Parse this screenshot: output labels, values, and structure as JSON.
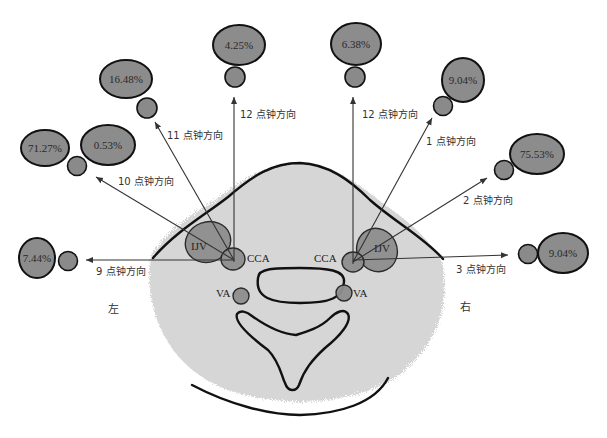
{
  "diagram": {
    "type": "neck cross-section clock-direction diagram",
    "side_labels": {
      "left": "左",
      "right": "右"
    },
    "structures": {
      "ijv_left": "IJV",
      "ijv_right": "IJV",
      "cca_left": "CCA",
      "cca_right": "CCA",
      "va_left": "VA",
      "va_right": "VA"
    },
    "left_directions": [
      {
        "clock": "9 点钟方向",
        "percent": "7.44%"
      },
      {
        "clock": "10 点钟方向",
        "percent": "71.27%",
        "percent_secondary": "0.53%"
      },
      {
        "clock": "11 点钟方向",
        "percent": "16.48%"
      },
      {
        "clock": "12 点钟方向",
        "percent": "4.25%"
      }
    ],
    "right_directions": [
      {
        "clock": "12 点钟方向",
        "percent": "6.38%"
      },
      {
        "clock": "1 点钟方向",
        "percent": "9.04%"
      },
      {
        "clock": "2 点钟方向",
        "percent": "75.53%"
      },
      {
        "clock": "3 点钟方向",
        "percent": "9.04%"
      }
    ],
    "colors": {
      "bubble_fill": "#8c8c8c",
      "neck_fill": "#d6d6d6",
      "outline": "#111111",
      "background": "#ffffff"
    }
  }
}
